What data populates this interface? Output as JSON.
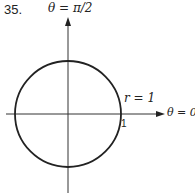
{
  "problem": {
    "number": "35."
  },
  "labels": {
    "theta_top": "θ = π/2",
    "theta_right": "θ = 0",
    "r_label": "r = 1",
    "tick_one": "1"
  },
  "diagram": {
    "type": "polar-circle",
    "equation": "r = 1",
    "center": [
      68,
      114
    ],
    "radius_px": 53,
    "stroke": "#222222"
  }
}
